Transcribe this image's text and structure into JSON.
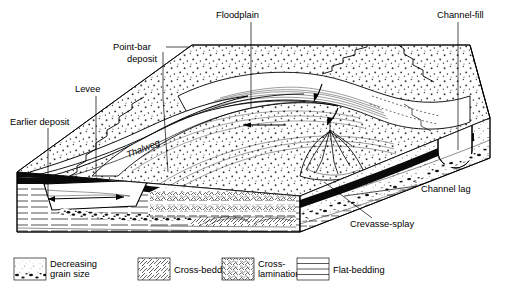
{
  "figure": {
    "type": "geological-block-diagram",
    "background": "#ffffff",
    "line_color": "#000000"
  },
  "labels": [
    {
      "id": "earlier-deposit",
      "text": "Earlier deposit",
      "x": 10,
      "y": 122,
      "anchor": "start",
      "lines": [
        "Earlier deposit"
      ]
    },
    {
      "id": "levee",
      "text": "Levee",
      "x": 75,
      "y": 91,
      "anchor": "start",
      "lines": [
        "Levee"
      ]
    },
    {
      "id": "point-bar",
      "text": "Point-bar deposit",
      "x": 113,
      "y": 49,
      "anchor": "start",
      "lines": [
        "Point-bar",
        "deposit"
      ]
    },
    {
      "id": "floodplain",
      "text": "Floodplain",
      "x": 216,
      "y": 15,
      "anchor": "start",
      "lines": [
        "Floodplain"
      ]
    },
    {
      "id": "channel-fill",
      "text": "Channel-fill",
      "x": 440,
      "y": 15,
      "anchor": "start",
      "lines": [
        "Channel-fill"
      ]
    },
    {
      "id": "channel-lag",
      "text": "Channel lag",
      "x": 419,
      "y": 189,
      "anchor": "start",
      "lines": [
        "Channel lag"
      ]
    },
    {
      "id": "crevasse-splay",
      "text": "Crevasse-splay",
      "x": 350,
      "y": 224,
      "anchor": "start",
      "lines": [
        "Crevasse-splay"
      ]
    },
    {
      "id": "thalweg",
      "text": "Thalweg",
      "x": 128,
      "y": 155,
      "anchor": "start",
      "italic": true,
      "rotate": -22,
      "lines": [
        "Thalweg"
      ]
    }
  ],
  "legend": {
    "items": [
      {
        "id": "decreasing-grain-size",
        "pattern": "graded-stipple",
        "lines": [
          "Decreasing",
          "grain  size"
        ],
        "swatch": {
          "x": 14,
          "y": 258,
          "w": 32,
          "h": 22
        },
        "text_x": 50
      },
      {
        "id": "cross-bedding",
        "pattern": "diagonal-hatch",
        "lines": [
          "Cross-bedding"
        ],
        "swatch": {
          "x": 138,
          "y": 258,
          "w": 32,
          "h": 22
        },
        "text_x": 174
      },
      {
        "id": "cross-lamination",
        "pattern": "ripple-scribble",
        "lines": [
          "Cross-",
          "lamination"
        ],
        "swatch": {
          "x": 222,
          "y": 258,
          "w": 32,
          "h": 22
        },
        "text_x": 258
      },
      {
        "id": "flat-bedding",
        "pattern": "horizontal-lines",
        "lines": [
          "Flat-bedding"
        ],
        "swatch": {
          "x": 297,
          "y": 258,
          "w": 32,
          "h": 22
        },
        "text_x": 333
      }
    ]
  },
  "block": {
    "top_face": "floodplain surface with stipple (sand) texture, meander channel, point bar, crevasse splay",
    "front_face": "cross-section: flat-bedding below, cross-bedding, cross-lamination, channel lag at base of sand body",
    "right_face": "cross-section showing channel-fill cut, black channel lag layer, stipple sand",
    "features": {
      "flow_arrows": 3,
      "channel_fill_shape": "U-shaped scour",
      "crevasse_splay_shape": "branching fan"
    }
  }
}
